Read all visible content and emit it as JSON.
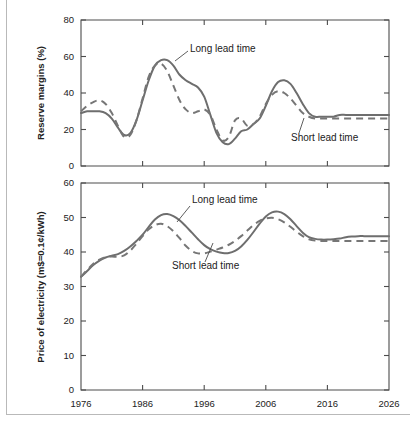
{
  "figure": {
    "name": "reserve-margins-and-electricity-price-forecast",
    "border_color": "#b9b9b9",
    "series_colors": {
      "long_lead_time": "#6e6e6e",
      "short_lead_time": "#767676"
    }
  },
  "chart_data": [
    {
      "type": "line",
      "id": "reserve-margins",
      "title": "",
      "xlabel": "",
      "ylabel": "Reserve margins (%)",
      "xlim": [
        1976,
        2026
      ],
      "ylim": [
        0,
        80
      ],
      "xticks": [
        1976,
        1986,
        1996,
        2006,
        2016,
        2026
      ],
      "xticklabels": [
        "1976",
        "1986",
        "1996",
        "2006",
        "2016",
        "2026"
      ],
      "yticks": [
        0,
        20,
        40,
        60,
        80
      ],
      "yticklabels": [
        "0",
        "20",
        "40",
        "60",
        "80"
      ],
      "grid": false,
      "legend": "annotations",
      "annotations": [
        {
          "text": "Long lead time",
          "series": "Long lead time"
        },
        {
          "text": "Short lead time",
          "series": "Short lead time"
        }
      ],
      "series": [
        {
          "name": "Long lead time",
          "style": "solid",
          "x": [
            1976,
            1977,
            1978,
            1979,
            1980,
            1981,
            1982,
            1983,
            1984,
            1985,
            1986,
            1987,
            1988,
            1989,
            1990,
            1991,
            1992,
            1993,
            1994,
            1995,
            1996,
            1997,
            1998,
            1999,
            2000,
            2001,
            2002,
            2003,
            2004,
            2005,
            2006,
            2007,
            2008,
            2009,
            2010,
            2011,
            2012,
            2013,
            2014,
            2015,
            2016,
            2017,
            2018,
            2019,
            2020,
            2021,
            2022,
            2023,
            2024,
            2025,
            2026
          ],
          "y": [
            29,
            30,
            30,
            30,
            29,
            26,
            21,
            17,
            18,
            25,
            36,
            47,
            55,
            58,
            58,
            55,
            50,
            47,
            45,
            43,
            38,
            28,
            18,
            13,
            12,
            15,
            19,
            20,
            23,
            26,
            33,
            41,
            46,
            47,
            45,
            40,
            34,
            29,
            27,
            27,
            27,
            27,
            28,
            28,
            28,
            28,
            28,
            28,
            28,
            28,
            28
          ]
        },
        {
          "name": "Short lead time",
          "style": "dashed",
          "x": [
            1976,
            1977,
            1978,
            1979,
            1980,
            1981,
            1982,
            1983,
            1984,
            1985,
            1986,
            1987,
            1988,
            1989,
            1990,
            1991,
            1992,
            1993,
            1994,
            1995,
            1996,
            1997,
            1998,
            1999,
            2000,
            2001,
            2002,
            2003,
            2004,
            2005,
            2006,
            2007,
            2008,
            2009,
            2010,
            2011,
            2012,
            2013,
            2014,
            2015,
            2016,
            2017,
            2018,
            2019,
            2020,
            2021,
            2022,
            2023,
            2024,
            2025,
            2026
          ],
          "y": [
            30,
            33,
            35,
            36,
            34,
            29,
            22,
            16,
            17,
            25,
            37,
            49,
            55,
            56,
            52,
            44,
            36,
            31,
            29,
            30,
            31,
            28,
            20,
            14,
            16,
            25,
            26,
            22,
            23,
            27,
            34,
            39,
            41,
            40,
            37,
            33,
            29,
            27,
            26,
            26,
            26,
            26,
            26,
            26,
            26,
            26,
            26,
            26,
            26,
            26,
            26
          ]
        }
      ]
    },
    {
      "type": "line",
      "id": "price-of-electricity",
      "title": "",
      "xlabel": "",
      "ylabel": "Price of electricity (m$=0.1¢/kWh)",
      "xlim": [
        1976,
        2026
      ],
      "ylim": [
        0,
        60
      ],
      "xticks": [
        1976,
        1986,
        1996,
        2006,
        2016,
        2026
      ],
      "xticklabels": [
        "1976",
        "1986",
        "1996",
        "2006",
        "2016",
        "2026"
      ],
      "yticks": [
        0,
        10,
        20,
        30,
        40,
        50,
        60
      ],
      "yticklabels": [
        "0",
        "10",
        "20",
        "30",
        "40",
        "50",
        "60"
      ],
      "grid": false,
      "legend": "annotations",
      "annotations": [
        {
          "text": "Long lead time",
          "series": "Long lead time"
        },
        {
          "text": "Short lead time",
          "series": "Short lead time"
        }
      ],
      "series": [
        {
          "name": "Long lead time",
          "style": "solid",
          "x": [
            1976,
            1977,
            1978,
            1979,
            1980,
            1981,
            1982,
            1983,
            1984,
            1985,
            1986,
            1987,
            1988,
            1989,
            1990,
            1991,
            1992,
            1993,
            1994,
            1995,
            1996,
            1997,
            1998,
            1999,
            2000,
            2001,
            2002,
            2003,
            2004,
            2005,
            2006,
            2007,
            2008,
            2009,
            2010,
            2011,
            2012,
            2013,
            2014,
            2015,
            2016,
            2017,
            2018,
            2019,
            2020,
            2021,
            2022,
            2023,
            2024,
            2025,
            2026
          ],
          "y": [
            32.8,
            34.5,
            36.2,
            37.5,
            38.4,
            38.9,
            39.4,
            40.3,
            41.6,
            43.2,
            45.0,
            47.3,
            49.4,
            50.7,
            51.0,
            50.4,
            49.2,
            47.5,
            45.6,
            43.7,
            42.0,
            40.8,
            40.1,
            39.7,
            39.7,
            40.3,
            41.6,
            43.5,
            45.8,
            48.2,
            50.3,
            51.5,
            51.7,
            51.0,
            49.5,
            47.5,
            45.6,
            44.3,
            43.8,
            43.6,
            43.6,
            43.7,
            43.9,
            44.3,
            44.5,
            44.6,
            44.6,
            44.6,
            44.6,
            44.6,
            44.6
          ]
        },
        {
          "name": "Short lead time",
          "style": "dashed",
          "x": [
            1976,
            1977,
            1978,
            1979,
            1980,
            1981,
            1982,
            1983,
            1984,
            1985,
            1986,
            1987,
            1988,
            1989,
            1990,
            1991,
            1992,
            1993,
            1994,
            1995,
            1996,
            1997,
            1998,
            1999,
            2000,
            2001,
            2002,
            2003,
            2004,
            2005,
            2006,
            2007,
            2008,
            2009,
            2010,
            2011,
            2012,
            2013,
            2014,
            2015,
            2016,
            2017,
            2018,
            2019,
            2020,
            2021,
            2022,
            2023,
            2024,
            2025,
            2026
          ],
          "y": [
            32.8,
            34.8,
            36.6,
            37.8,
            38.5,
            38.7,
            38.6,
            39.0,
            40.4,
            42.4,
            44.6,
            46.6,
            47.8,
            48.2,
            47.5,
            46.0,
            44.0,
            41.8,
            40.3,
            39.6,
            39.6,
            40.1,
            40.7,
            41.3,
            42.1,
            43.2,
            44.6,
            46.2,
            47.8,
            49.0,
            49.7,
            49.9,
            49.5,
            48.6,
            47.3,
            45.9,
            44.6,
            43.7,
            43.3,
            43.2,
            43.2,
            43.2,
            43.2,
            43.2,
            43.2,
            43.2,
            43.2,
            43.2,
            43.2,
            43.2,
            43.2
          ]
        }
      ]
    }
  ]
}
